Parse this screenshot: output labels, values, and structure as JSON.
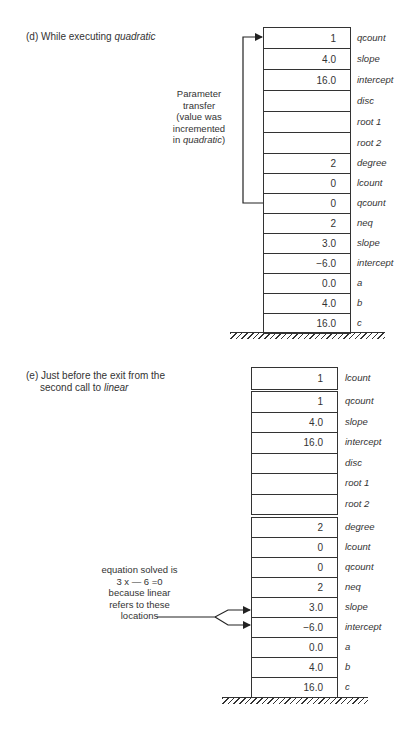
{
  "diagram_d": {
    "caption_prefix": "(d) While executing ",
    "caption_italic": "quadratic",
    "note_lines": [
      "Parameter",
      "transfer",
      "(value was",
      "incremented",
      "in "
    ],
    "note_italic": "quadratic",
    "note_suffix": ")",
    "section1": [
      {
        "value": "1",
        "name": "qcount"
      },
      {
        "value": "4.0",
        "name": "slope"
      },
      {
        "value": "16.0",
        "name": "intercept"
      },
      {
        "value": "",
        "name": "disc"
      },
      {
        "value": "",
        "name": "root 1"
      },
      {
        "value": "",
        "name": "root 2"
      }
    ],
    "section2": [
      {
        "value": "2",
        "name": "degree"
      },
      {
        "value": "0",
        "name": "lcount"
      },
      {
        "value": "0",
        "name": "qcount"
      },
      {
        "value": "2",
        "name": "neq"
      },
      {
        "value": "3.0",
        "name": "slope"
      },
      {
        "value": "−6.0",
        "name": "intercept"
      },
      {
        "value": "0.0",
        "name": "a"
      },
      {
        "value": "4.0",
        "name": "b"
      },
      {
        "value": "16.0",
        "name": "c"
      }
    ]
  },
  "diagram_e": {
    "caption_line1": "(e) Just before the exit from the",
    "caption_line2_prefix": "second call to ",
    "caption_italic": "linear",
    "note_lines": [
      "equation solved is",
      "3 x — 6 =0",
      "because linear",
      "refers to these",
      "locations"
    ],
    "section0": [
      {
        "value": "1",
        "name": "lcount"
      }
    ],
    "section1": [
      {
        "value": "1",
        "name": "qcount"
      },
      {
        "value": "4.0",
        "name": "slope"
      },
      {
        "value": "16.0",
        "name": "intercept"
      },
      {
        "value": "",
        "name": "disc"
      },
      {
        "value": "",
        "name": "root 1"
      },
      {
        "value": "",
        "name": "root 2"
      }
    ],
    "section2": [
      {
        "value": "2",
        "name": "degree"
      },
      {
        "value": "0",
        "name": "lcount"
      },
      {
        "value": "0",
        "name": "qcount"
      },
      {
        "value": "2",
        "name": "neq"
      },
      {
        "value": "3.0",
        "name": "slope"
      },
      {
        "value": "−6.0",
        "name": "intercept"
      },
      {
        "value": "0.0",
        "name": "a"
      },
      {
        "value": "4.0",
        "name": "b"
      },
      {
        "value": "16.0",
        "name": "c"
      }
    ]
  }
}
